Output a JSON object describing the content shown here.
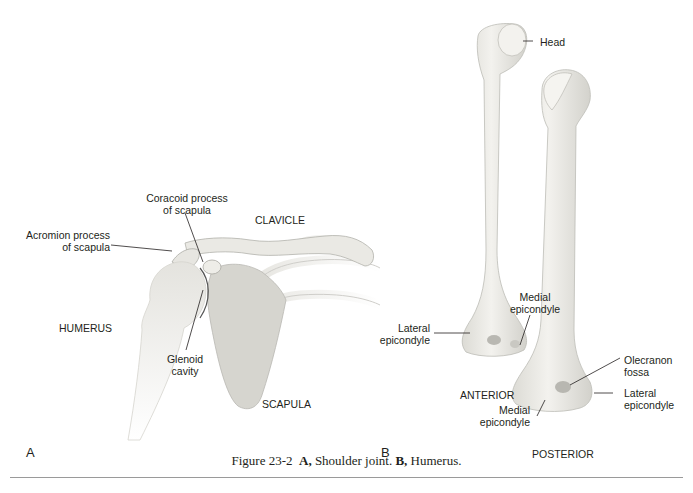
{
  "figure": {
    "number": "Figure 23-2",
    "caption_parts": {
      "number": "Figure 23-2",
      "a_letter": "A,",
      "a_text": " Shoulder joint. ",
      "b_letter": "B,",
      "b_text": " Humerus."
    }
  },
  "panel_a": {
    "letter": "A",
    "title": "Shoulder joint",
    "labels": {
      "coracoid_line1": "Coracoid process",
      "coracoid_line2": "of scapula",
      "clavicle": "CLAVICLE",
      "acromion_line1": "Acromion process",
      "acromion_line2": "of scapula",
      "humerus": "HUMERUS",
      "glenoid_line1": "Glenoid",
      "glenoid_line2": "cavity",
      "scapula": "SCAPULA"
    }
  },
  "panel_b": {
    "letter": "B",
    "title": "Humerus",
    "labels": {
      "head": "Head",
      "medial_epi_ant_line1": "Medial",
      "medial_epi_ant_line2": "epicondyle",
      "lateral_epi_ant_line1": "Lateral",
      "lateral_epi_ant_line2": "epicondyle",
      "olecranon_line1": "Olecranon",
      "olecranon_line2": "fossa",
      "lateral_epi_post_line1": "Lateral",
      "lateral_epi_post_line2": "epicondyle",
      "anterior": "ANTERIOR",
      "medial_epi_post_line1": "Medial",
      "medial_epi_post_line2": "epicondyle",
      "posterior": "POSTERIOR"
    }
  },
  "colors": {
    "bone_fill": "#ecebe6",
    "bone_shade": "#d6d5cf",
    "scapula_fill": "#d9d8d2",
    "line": "#231f20",
    "rule": "#9a9a9a"
  }
}
